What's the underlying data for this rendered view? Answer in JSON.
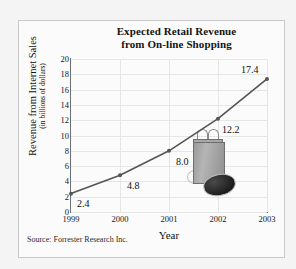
{
  "chart_data": {
    "type": "line",
    "title": "Expected Retail Revenue from On-line Shopping",
    "title_line1": "Expected Retail Revenue",
    "title_line2": "from On-line Shopping",
    "xlabel": "Year",
    "ylabel": "Revenue from Internet Sales",
    "ylabel_sub": "(in billions of dollars)",
    "categories": [
      "1999",
      "2000",
      "2001",
      "2002",
      "2003"
    ],
    "values": [
      2.4,
      4.8,
      8.0,
      12.2,
      17.4
    ],
    "point_labels": [
      "2.4",
      "4.8",
      "8.0",
      "12.2",
      "17.4"
    ],
    "ylim": [
      0,
      20
    ],
    "yticks": [
      "20",
      "18",
      "16",
      "14",
      "12",
      "10",
      "8",
      "6",
      "4",
      "2",
      "0"
    ],
    "grid": true,
    "legend": "none",
    "series_color": "#555555",
    "source": "Source: Forrester Research Inc."
  },
  "illustration": {
    "bag_name": "shopping-bag",
    "mouse_name": "computer-mouse"
  }
}
